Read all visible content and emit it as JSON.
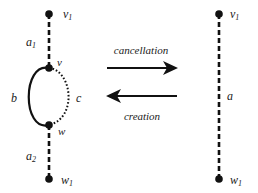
{
  "left_graph": {
    "vertices": {
      "v1": {
        "label": "v",
        "sub": "1"
      },
      "v": {
        "label": "v"
      },
      "w": {
        "label": "w"
      },
      "w1": {
        "label": "w",
        "sub": "1"
      }
    },
    "edges": {
      "a1": {
        "label": "a",
        "sub": "1",
        "style": "dashed"
      },
      "b": {
        "label": "b",
        "style": "solid"
      },
      "c": {
        "label": "c",
        "style": "dotted"
      },
      "a2": {
        "label": "a",
        "sub": "2",
        "style": "dashed"
      }
    }
  },
  "arrows": {
    "forward": {
      "label": "cancellation",
      "direction": "right"
    },
    "backward": {
      "label": "creation",
      "direction": "left"
    }
  },
  "right_graph": {
    "vertices": {
      "v1": {
        "label": "v",
        "sub": "1"
      },
      "w1": {
        "label": "w",
        "sub": "1"
      }
    },
    "edges": {
      "a": {
        "label": "a",
        "style": "dashed"
      }
    }
  },
  "colors": {
    "ink": "#111111",
    "background": "#ffffff"
  }
}
